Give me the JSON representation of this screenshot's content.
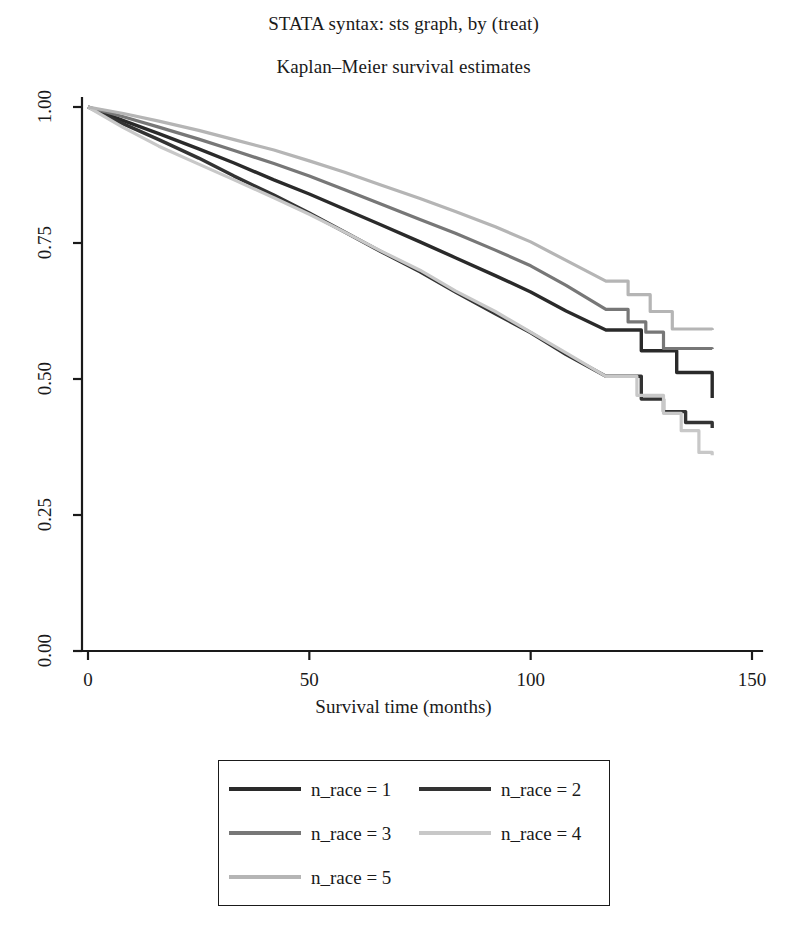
{
  "titles": {
    "line1": "STATA syntax: sts graph, by (treat)",
    "line2": "Kaplan–Meier survival estimates"
  },
  "chart_data": {
    "type": "line",
    "title": "Kaplan–Meier survival estimates",
    "subtitle": "STATA syntax: sts graph, by (treat)",
    "xlabel": "Survival time (months)",
    "ylabel": "",
    "xlim": [
      0,
      150
    ],
    "ylim": [
      0.0,
      1.0
    ],
    "xticks": [
      0,
      50,
      100,
      150
    ],
    "xticklabels": [
      "0",
      "50",
      "100",
      "150"
    ],
    "yticks": [
      0.0,
      0.25,
      0.5,
      0.75,
      1.0
    ],
    "yticklabels": [
      "0.00",
      "0.25",
      "0.50",
      "0.75",
      "1.00"
    ],
    "grid": false,
    "legend_position": "below-center",
    "step": true,
    "series": [
      {
        "name": "n_race = 1",
        "color": "#2a2a2a",
        "width": 3.4,
        "x": [
          0,
          8,
          16,
          25,
          33,
          42,
          50,
          58,
          66,
          75,
          83,
          92,
          100,
          108,
          117,
          125,
          133,
          141
        ],
        "y": [
          1.0,
          0.975,
          0.951,
          0.923,
          0.897,
          0.866,
          0.84,
          0.812,
          0.784,
          0.752,
          0.723,
          0.69,
          0.66,
          0.625,
          0.59,
          0.552,
          0.512,
          0.465
        ]
      },
      {
        "name": "n_race = 2",
        "color": "#333333",
        "width": 3.4,
        "x": [
          0,
          8,
          16,
          25,
          33,
          42,
          50,
          58,
          66,
          75,
          83,
          92,
          100,
          108,
          117,
          125,
          130,
          135,
          141
        ],
        "y": [
          1.0,
          0.969,
          0.94,
          0.906,
          0.873,
          0.838,
          0.805,
          0.77,
          0.735,
          0.697,
          0.66,
          0.62,
          0.585,
          0.545,
          0.505,
          0.463,
          0.44,
          0.42,
          0.41
        ]
      },
      {
        "name": "n_race = 3",
        "color": "#777777",
        "width": 3.2,
        "x": [
          0,
          8,
          16,
          25,
          33,
          42,
          50,
          58,
          66,
          75,
          83,
          92,
          100,
          108,
          117,
          122,
          126,
          130,
          141
        ],
        "y": [
          1.0,
          0.982,
          0.963,
          0.941,
          0.92,
          0.896,
          0.873,
          0.848,
          0.822,
          0.793,
          0.768,
          0.737,
          0.708,
          0.672,
          0.628,
          0.605,
          0.586,
          0.556,
          0.555
        ]
      },
      {
        "name": "n_race = 4",
        "color": "#c8c8c8",
        "width": 3.2,
        "x": [
          0,
          8,
          16,
          25,
          33,
          42,
          50,
          58,
          66,
          75,
          83,
          92,
          100,
          108,
          117,
          124,
          130,
          134,
          138,
          141
        ],
        "y": [
          1.0,
          0.962,
          0.928,
          0.895,
          0.866,
          0.833,
          0.803,
          0.77,
          0.736,
          0.7,
          0.662,
          0.624,
          0.586,
          0.548,
          0.505,
          0.47,
          0.437,
          0.405,
          0.365,
          0.36
        ]
      },
      {
        "name": "n_race = 5",
        "color": "#b5b5b5",
        "width": 3.2,
        "x": [
          0,
          8,
          16,
          25,
          33,
          42,
          50,
          58,
          66,
          75,
          83,
          92,
          100,
          108,
          117,
          122,
          127,
          132,
          141
        ],
        "y": [
          1.0,
          0.988,
          0.974,
          0.957,
          0.94,
          0.921,
          0.901,
          0.88,
          0.857,
          0.832,
          0.808,
          0.78,
          0.752,
          0.718,
          0.68,
          0.655,
          0.624,
          0.592,
          0.59
        ]
      }
    ]
  },
  "legend": {
    "entries": [
      {
        "label": "n_race = 1",
        "color": "#2a2a2a"
      },
      {
        "label": "n_race = 2",
        "color": "#333333"
      },
      {
        "label": "n_race = 3",
        "color": "#777777"
      },
      {
        "label": "n_race = 4",
        "color": "#c8c8c8"
      },
      {
        "label": "n_race = 5",
        "color": "#b5b5b5"
      }
    ]
  },
  "axis_style": {
    "line_color": "#1a1a1a",
    "tick_length": 9
  }
}
